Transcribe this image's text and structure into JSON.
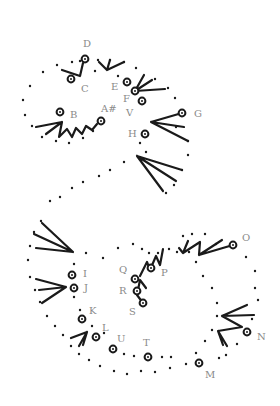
{
  "colors": {
    "ink": "#1a1a1a",
    "label": "#8a8a8a",
    "background": "#ffffff"
  },
  "labels": [
    {
      "text": "D",
      "x": 83,
      "y": 47
    },
    {
      "text": "C",
      "x": 81,
      "y": 92
    },
    {
      "text": "E",
      "x": 111,
      "y": 90
    },
    {
      "text": "F",
      "x": 123,
      "y": 102
    },
    {
      "text": "V",
      "x": 126,
      "y": 116
    },
    {
      "text": "A#",
      "x": 101,
      "y": 112
    },
    {
      "text": "B",
      "x": 70,
      "y": 118
    },
    {
      "text": "G",
      "x": 194,
      "y": 117
    },
    {
      "text": "H",
      "x": 128,
      "y": 137
    },
    {
      "text": "I",
      "x": 83,
      "y": 277
    },
    {
      "text": "J",
      "x": 84,
      "y": 291
    },
    {
      "text": "Q",
      "x": 119,
      "y": 273
    },
    {
      "text": "P",
      "x": 161,
      "y": 276
    },
    {
      "text": "R",
      "x": 119,
      "y": 294
    },
    {
      "text": "S",
      "x": 129,
      "y": 315
    },
    {
      "text": "K",
      "x": 89,
      "y": 314
    },
    {
      "text": "L",
      "x": 102,
      "y": 331
    },
    {
      "text": "U",
      "x": 117,
      "y": 342
    },
    {
      "text": "T",
      "x": 143,
      "y": 346
    },
    {
      "text": "O",
      "x": 242,
      "y": 241
    },
    {
      "text": "N",
      "x": 257,
      "y": 340
    },
    {
      "text": "M",
      "x": 205,
      "y": 378
    }
  ],
  "circles": [
    [
      85,
      59
    ],
    [
      71,
      79
    ],
    [
      127,
      82
    ],
    [
      135,
      91
    ],
    [
      142,
      101
    ],
    [
      60,
      112
    ],
    [
      101,
      121
    ],
    [
      182,
      113
    ],
    [
      145,
      134
    ],
    [
      72,
      275
    ],
    [
      74,
      288
    ],
    [
      151,
      268
    ],
    [
      135,
      279
    ],
    [
      137,
      291
    ],
    [
      143,
      303
    ],
    [
      82,
      319
    ],
    [
      96,
      337
    ],
    [
      113,
      349
    ],
    [
      148,
      357
    ],
    [
      199,
      363
    ],
    [
      247,
      332
    ],
    [
      233,
      245
    ]
  ],
  "dots": [
    [
      57,
      65
    ],
    [
      43,
      72
    ],
    [
      30,
      86
    ],
    [
      23,
      100
    ],
    [
      25,
      115
    ],
    [
      32,
      126
    ],
    [
      42,
      137
    ],
    [
      56,
      141
    ],
    [
      69,
      143
    ],
    [
      83,
      138
    ],
    [
      93,
      131
    ],
    [
      72,
      62
    ],
    [
      80,
      61
    ],
    [
      95,
      71
    ],
    [
      98,
      60
    ],
    [
      110,
      60
    ],
    [
      124,
      62
    ],
    [
      118,
      76
    ],
    [
      136,
      68
    ],
    [
      155,
      79
    ],
    [
      168,
      88
    ],
    [
      175,
      98
    ],
    [
      176,
      127
    ],
    [
      188,
      141
    ],
    [
      188,
      155
    ],
    [
      182,
      170
    ],
    [
      174,
      185
    ],
    [
      166,
      193
    ],
    [
      146,
      152
    ],
    [
      140,
      143
    ],
    [
      124,
      162
    ],
    [
      110,
      170
    ],
    [
      99,
      176
    ],
    [
      83,
      182
    ],
    [
      72,
      188
    ],
    [
      60,
      197
    ],
    [
      50,
      201
    ],
    [
      41,
      221
    ],
    [
      34,
      232
    ],
    [
      30,
      246
    ],
    [
      28,
      260
    ],
    [
      30,
      277
    ],
    [
      35,
      290
    ],
    [
      40,
      302
    ],
    [
      47,
      316
    ],
    [
      55,
      326
    ],
    [
      63,
      335
    ],
    [
      71,
      346
    ],
    [
      79,
      354
    ],
    [
      89,
      360
    ],
    [
      100,
      366
    ],
    [
      114,
      371
    ],
    [
      127,
      374
    ],
    [
      141,
      371
    ],
    [
      155,
      372
    ],
    [
      170,
      368
    ],
    [
      186,
      364
    ],
    [
      196,
      353
    ],
    [
      205,
      341
    ],
    [
      212,
      330
    ],
    [
      217,
      316
    ],
    [
      217,
      303
    ],
    [
      212,
      288
    ],
    [
      203,
      276
    ],
    [
      196,
      262
    ],
    [
      189,
      252
    ],
    [
      177,
      252
    ],
    [
      169,
      249
    ],
    [
      158,
      253
    ],
    [
      149,
      253
    ],
    [
      142,
      249
    ],
    [
      133,
      244
    ],
    [
      118,
      248
    ],
    [
      103,
      258
    ],
    [
      86,
      253
    ],
    [
      74,
      264
    ],
    [
      74,
      297
    ],
    [
      80,
      310
    ],
    [
      92,
      326
    ],
    [
      104,
      333
    ],
    [
      124,
      354
    ],
    [
      134,
      356
    ],
    [
      162,
      357
    ],
    [
      171,
      357
    ],
    [
      219,
      358
    ],
    [
      226,
      355
    ],
    [
      237,
      344
    ],
    [
      252,
      319
    ],
    [
      258,
      300
    ],
    [
      255,
      288
    ],
    [
      255,
      271
    ],
    [
      246,
      257
    ],
    [
      216,
      244
    ],
    [
      205,
      234
    ],
    [
      192,
      234
    ],
    [
      183,
      236
    ]
  ],
  "strokes": [
    "M62,70 L80,76 L83,63",
    "M99,62 L107,70 L110,60 M107,70 L124,62",
    "M135,91 L144,75 M135,91 L152,80 M135,91 L165,89",
    "M36,127 L62,122 L59,137 L67,129 L72,137 L76,128 L82,134 L86,126 L92,130 L97,124 M62,122 L46,134",
    "M182,113 L151,122 L184,127 M151,122 L188,141",
    "M137,156 L182,170 M137,156 L176,181 M137,156 L163,191",
    "M42,223 L73,252 L36,248 M73,252 L34,234",
    "M36,279 L66,287 L39,290 M66,287 L42,303",
    "M71,338 L87,332 L79,346 M87,332 L83,345",
    "M179,248 L183,253 L188,241 M183,253 L200,242 M199,255 L200,242 M199,255 L222,240 M199,255 L233,245",
    "M140,276 L147,262 L150,270 L156,256 L160,265 L163,249 M137,295 L140,280 L146,288 M143,303 L137,295",
    "M222,316 L247,305 M222,316 L254,315 M222,316 L242,327 L218,331 L227,346 M218,331 L223,345"
  ]
}
